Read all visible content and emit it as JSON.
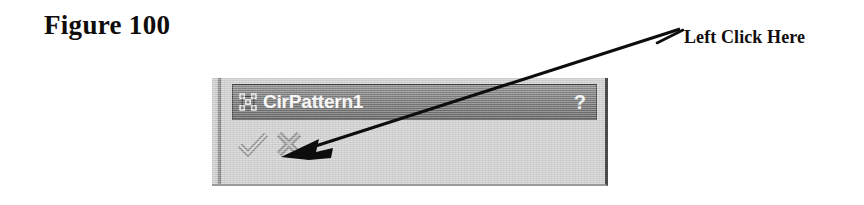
{
  "figure": {
    "label": "Figure 100"
  },
  "annotation": {
    "callout_label": "Left Click Here",
    "arrow_from": [
      680,
      29
    ],
    "arrow_to": [
      281,
      157
    ],
    "leader_from": [
      657,
      43
    ],
    "leader_to": [
      683,
      30
    ],
    "color": "#0d0d0d"
  },
  "dialog": {
    "name": "property-manager",
    "title": "CirPattern1",
    "title_icon": "circular-pattern-icon",
    "help_label": "?",
    "titlebar_color": "#787878",
    "body_color": "#cfcfcf",
    "title_text_color": "#fbfbfb",
    "buttons": [
      {
        "name": "ok-button",
        "icon": "checkmark-icon",
        "label": "OK"
      },
      {
        "name": "cancel-button",
        "icon": "x-mark-icon",
        "label": "Cancel"
      }
    ]
  }
}
